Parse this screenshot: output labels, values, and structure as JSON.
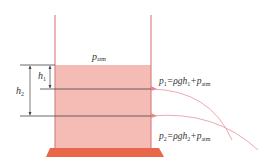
{
  "diagram": {
    "labels": {
      "surface_pressure": "p",
      "surface_pressure_sub": "atm",
      "h1": "h",
      "h1_sub": "1",
      "h2": "h",
      "h2_sub": "2",
      "p1_main": "p",
      "p1_sub": "1",
      "p1_eq": "=ρgh",
      "p1_h_sub": "1",
      "p1_plus": "+p",
      "p1_atm": "atm",
      "p2_main": "p",
      "p2_sub": "2",
      "p2_eq": "=ρgh",
      "p2_h_sub": "2",
      "p2_plus": "+p",
      "p2_atm": "atm"
    },
    "colors": {
      "liquid": "#f2b5ae",
      "wall": "#d9848a",
      "base": "#e8674a",
      "line": "#444444",
      "jet": "#e8a0a8"
    }
  }
}
